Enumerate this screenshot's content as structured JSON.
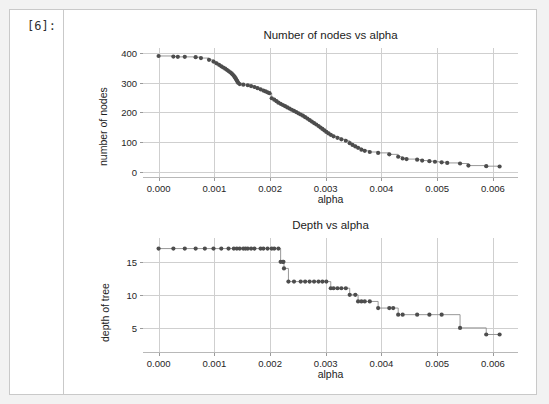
{
  "notebook": {
    "prompt_label": "[6]:"
  },
  "colors": {
    "marker": "#4d4d4d",
    "line": "#8c8c8c",
    "grid": "#cfcfcf",
    "text": "#262626",
    "cell_border": "#c9c9c9",
    "page_background": "#f2f2f2",
    "cell_background": "#ffffff"
  },
  "chart_data": [
    {
      "type": "line",
      "id": "nodes-vs-alpha",
      "title": "Number of nodes vs alpha",
      "xlabel": "alpha",
      "ylabel": "number of nodes",
      "xlim": [
        -0.00028,
        0.00645
      ],
      "ylim": [
        -22,
        418
      ],
      "xticks": [
        0.0,
        0.001,
        0.002,
        0.003,
        0.004,
        0.005,
        0.006
      ],
      "xticklabels": [
        "0.000",
        "0.001",
        "0.002",
        "0.003",
        "0.004",
        "0.005",
        "0.006"
      ],
      "yticks": [
        0,
        100,
        200,
        300,
        400
      ],
      "yticklabels": [
        "0",
        "100",
        "200",
        "300",
        "400"
      ],
      "grid": true,
      "drawstyle": "steps-post",
      "marker": "o",
      "x": [
        0.0,
        0.000265,
        0.000345,
        0.00047,
        0.000665,
        0.00076,
        0.000905,
        0.000985,
        0.00104,
        0.001085,
        0.001125,
        0.00116,
        0.001195,
        0.001225,
        0.001255,
        0.001285,
        0.00131,
        0.00133,
        0.00135,
        0.001365,
        0.00138,
        0.001392,
        0.001404,
        0.001416,
        0.001428,
        0.001455,
        0.00152,
        0.0016,
        0.00166,
        0.00172,
        0.001775,
        0.00183,
        0.00188,
        0.00192,
        0.001955,
        0.00199,
        0.00203,
        0.002075,
        0.002115,
        0.00215,
        0.00219,
        0.00223,
        0.00227,
        0.00231,
        0.00235,
        0.00239,
        0.00243,
        0.00247,
        0.00251,
        0.00255,
        0.00259,
        0.00263,
        0.00267,
        0.00271,
        0.00275,
        0.00279,
        0.00283,
        0.00287,
        0.002905,
        0.00294,
        0.002975,
        0.00301,
        0.00305,
        0.00309,
        0.00314,
        0.00321,
        0.00328,
        0.00336,
        0.00343,
        0.00348,
        0.00353,
        0.00358,
        0.00364,
        0.0037,
        0.00379,
        0.00394,
        0.00414,
        0.0043,
        0.00438,
        0.00445,
        0.00464,
        0.00473,
        0.00486,
        0.00496,
        0.00508,
        0.00518,
        0.00541,
        0.00556,
        0.00588,
        0.00612
      ],
      "y": [
        391,
        389,
        388,
        388,
        387,
        384,
        378,
        372,
        366,
        361,
        356,
        352,
        348,
        344,
        340,
        336,
        332,
        328,
        324,
        320,
        316,
        312,
        308,
        304,
        300,
        296,
        294,
        292,
        289,
        286,
        282,
        278,
        274,
        271,
        268,
        265,
        248,
        243,
        238,
        233,
        229,
        225,
        221,
        217,
        213,
        209,
        205,
        201,
        197,
        193,
        189,
        184,
        179,
        174,
        169,
        164,
        159,
        154,
        149,
        144,
        139,
        134,
        129,
        124,
        119,
        114,
        109,
        104,
        96,
        90,
        85,
        80,
        74,
        70,
        66,
        63,
        58,
        50,
        44,
        42,
        40,
        37,
        35,
        33,
        31,
        29,
        27,
        20,
        18,
        17
      ],
      "n_points": 91
    },
    {
      "type": "line",
      "id": "depth-vs-alpha",
      "title": "Depth vs alpha",
      "xlabel": "alpha",
      "ylabel": "depth of tree",
      "xlim": [
        -0.00028,
        0.00645
      ],
      "ylim": [
        1.2,
        18.6
      ],
      "xticks": [
        0.0,
        0.001,
        0.002,
        0.003,
        0.004,
        0.005,
        0.006
      ],
      "xticklabels": [
        "0.000",
        "0.001",
        "0.002",
        "0.003",
        "0.004",
        "0.005",
        "0.006"
      ],
      "yticks": [
        5,
        10,
        15
      ],
      "yticklabels": [
        "5",
        "10",
        "15"
      ],
      "grid": true,
      "drawstyle": "steps-post",
      "marker": "o",
      "x": [
        0.0,
        0.000265,
        0.00047,
        0.000665,
        0.00083,
        0.000985,
        0.001125,
        0.001255,
        0.00135,
        0.001404,
        0.001455,
        0.00152,
        0.00156,
        0.0016,
        0.00166,
        0.00172,
        0.00183,
        0.00188,
        0.001955,
        0.00203,
        0.002075,
        0.00215,
        0.00219,
        0.00223,
        0.00224,
        0.00225,
        0.00233,
        0.00243,
        0.00255,
        0.00263,
        0.00271,
        0.00279,
        0.00287,
        0.00294,
        0.00301,
        0.00309,
        0.00314,
        0.00321,
        0.00328,
        0.00336,
        0.00343,
        0.00353,
        0.00358,
        0.00364,
        0.0037,
        0.00379,
        0.00394,
        0.00414,
        0.00421,
        0.0043,
        0.00438,
        0.00464,
        0.00486,
        0.00508,
        0.00541,
        0.00588,
        0.00612
      ],
      "y": [
        17,
        17,
        17,
        17,
        17,
        17,
        17,
        17,
        17,
        17,
        17,
        17,
        17,
        17,
        17,
        17,
        17,
        17,
        17,
        17,
        17,
        17,
        15,
        15,
        15,
        14,
        12,
        12,
        12,
        12,
        12,
        12,
        12,
        12,
        12,
        11,
        11,
        11,
        11,
        11,
        10,
        10,
        9,
        9,
        9,
        9,
        8,
        8,
        8,
        7,
        7,
        7,
        7,
        7,
        5,
        4,
        4
      ],
      "n_points": 57
    }
  ]
}
